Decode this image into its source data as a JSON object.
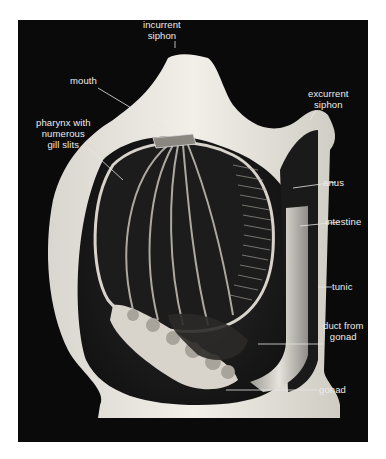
{
  "figure": {
    "background_color": "#0a0a0a",
    "label_color": "#ececec",
    "labels": [
      {
        "id": "incurrent-siphon",
        "line1": "incurrent",
        "line2": "siphon"
      },
      {
        "id": "mouth",
        "line1": "mouth"
      },
      {
        "id": "excurrent-siphon",
        "line1": "excurrent",
        "line2": "siphon"
      },
      {
        "id": "pharynx",
        "line1": "pharynx with",
        "line2": "numerous",
        "line3": "gill slits"
      },
      {
        "id": "anus",
        "line1": "anus"
      },
      {
        "id": "intestine",
        "line1": "intestine"
      },
      {
        "id": "tunic",
        "line1": "tunic"
      },
      {
        "id": "duct-from-gonad",
        "line1": "duct from",
        "line2": "gonad"
      },
      {
        "id": "gonad",
        "line1": "gonad"
      }
    ]
  }
}
